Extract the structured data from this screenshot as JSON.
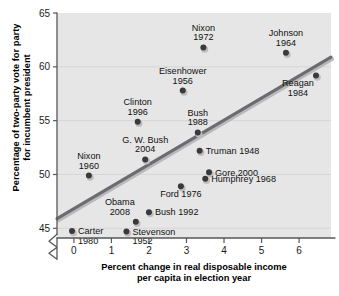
{
  "chart_data": {
    "type": "scatter",
    "title": "",
    "xlabel": "Percent change in real disposable income per capita in election year",
    "xlabel_line1": "Percent change in real disposable income",
    "xlabel_line2": "per capita in election year",
    "ylabel": "Percentage of two-party vote for party for incumbent president",
    "ylabel_line1": "Percentage of two-party vote for party",
    "ylabel_line2": "for incumbent president",
    "xlim": [
      -0.45,
      6.85
    ],
    "ylim": [
      44.1,
      65.0
    ],
    "xticks": [
      "0",
      "1",
      "2",
      "3",
      "4",
      "5",
      "6"
    ],
    "xtick_values": [
      0,
      1,
      2,
      3,
      4,
      5,
      6
    ],
    "yticks": [
      "45",
      "50",
      "55",
      "60",
      "65"
    ],
    "ytick_values": [
      45,
      50,
      55,
      60,
      65
    ],
    "grid": true,
    "y_axis_broken": true,
    "legend": "none",
    "colors": {
      "plot_background": "#e6e6e6",
      "point": "#3a3a3c",
      "trend_line": "#6b6b70",
      "gridline": "#d2d2d2",
      "axis": "#58585a",
      "text": "#111111"
    },
    "trend_line_points": [
      {
        "x": -0.45,
        "y": 45.9
      },
      {
        "x": 6.85,
        "y": 60.9
      }
    ],
    "points": [
      {
        "label_line1": "Nixon",
        "label_line2": "1972",
        "label": "Nixon 1972",
        "x": 3.45,
        "y": 61.8,
        "label_pos": "above"
      },
      {
        "label_line1": "Johnson",
        "label_line2": "1964",
        "label": "Johnson 1964",
        "x": 5.65,
        "y": 61.3,
        "label_pos": "above"
      },
      {
        "label_line1": "Eisenhower",
        "label_line2": "1956",
        "label": "Eisenhower 1956",
        "x": 2.9,
        "y": 57.8,
        "label_pos": "above"
      },
      {
        "label_line1": "Reagan",
        "label_line2": "1984",
        "label": "Reagan 1984",
        "x": 6.45,
        "y": 59.2,
        "label_pos": "below-left"
      },
      {
        "label_line1": "Clinton",
        "label_line2": "1996",
        "label": "Clinton 1996",
        "x": 1.7,
        "y": 54.9,
        "label_pos": "above"
      },
      {
        "label_line1": "Bush",
        "label_line2": "1988",
        "label": "Bush 1988",
        "x": 3.3,
        "y": 53.9,
        "label_pos": "above"
      },
      {
        "label_line1": "G. W. Bush",
        "label_line2": "2004",
        "label": "G. W. Bush 2004",
        "x": 1.9,
        "y": 51.4,
        "label_pos": "above"
      },
      {
        "label_line1": "Truman 1948",
        "label_line2": "",
        "label": "Truman 1948",
        "x": 3.35,
        "y": 52.2,
        "label_pos": "right"
      },
      {
        "label_line1": "Gore 2000",
        "label_line2": "",
        "label": "Gore 2000",
        "x": 3.6,
        "y": 50.2,
        "label_pos": "right"
      },
      {
        "label_line1": "Humphrey 1968",
        "label_line2": "",
        "label": "Humphrey 1968",
        "x": 3.5,
        "y": 49.6,
        "label_pos": "right"
      },
      {
        "label_line1": "Nixon",
        "label_line2": "1960",
        "label": "Nixon 1960",
        "x": 0.4,
        "y": 49.9,
        "label_pos": "above"
      },
      {
        "label_line1": "Ford 1976",
        "label_line2": "",
        "label": "Ford 1976",
        "x": 2.85,
        "y": 48.9,
        "label_pos": "below"
      },
      {
        "label_line1": "Bush 1992",
        "label_line2": "",
        "label": "Bush 1992",
        "x": 2.0,
        "y": 46.5,
        "label_pos": "right"
      },
      {
        "label_line1": "Obama",
        "label_line2": "2008",
        "label": "Obama 2008",
        "x": 1.65,
        "y": 45.6,
        "label_pos": "above-left"
      },
      {
        "label_line1": "Stevenson",
        "label_line2": "1952",
        "label": "Stevenson 1952",
        "x": 1.4,
        "y": 44.7,
        "label_pos": "right"
      },
      {
        "label_line1": "Carter",
        "label_line2": "1980",
        "label": "Carter 1980",
        "x": -0.05,
        "y": 44.75,
        "label_pos": "right"
      }
    ]
  }
}
